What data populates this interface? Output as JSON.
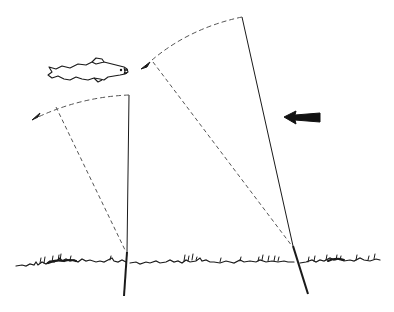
{
  "figure": {
    "title": "",
    "colors": {
      "background": "#ffffff",
      "ink": "#1a1a1a",
      "dashed": "#555555"
    },
    "elements": {
      "fish": {
        "label": "trout",
        "icon": "fish-icon"
      },
      "arrow": {
        "label": "direction arrow pointing left",
        "icon": "arrow-left-icon"
      },
      "rod_left": {
        "label": "short rod with casting arc"
      },
      "rod_right": {
        "label": "long rod with casting arc"
      },
      "ground": {
        "label": "grass line"
      }
    }
  }
}
